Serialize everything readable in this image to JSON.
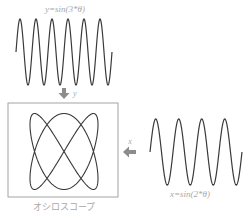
{
  "diagram": {
    "vertical_signal": {
      "label": "y=sin(3*θ)",
      "frequency_multiplier": 3,
      "arrow_label": "y"
    },
    "horizontal_signal": {
      "label": "x=sin(2*θ)",
      "frequency_multiplier": 2,
      "arrow_label": "x"
    },
    "oscilloscope": {
      "label": "オシロスコープ",
      "figure": "lissajous",
      "x_frequency": 2,
      "y_frequency": 3
    },
    "colors": {
      "stroke": "#3a3a3a",
      "label": "#a8a8a8",
      "arrow": "#8c8c8c",
      "frame": "#9a9a9a"
    }
  }
}
